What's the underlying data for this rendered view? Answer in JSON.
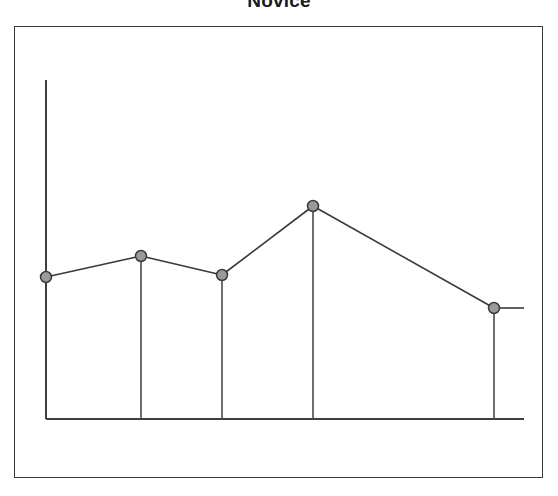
{
  "figure": {
    "title": "Novice",
    "background_color": "#ffffff",
    "frame": {
      "x": 14,
      "y": 26,
      "width": 529,
      "height": 452,
      "border_color": "#3a3a3a"
    }
  },
  "axes": {
    "origin_x": 46,
    "baseline_y": 419,
    "y_axis_top_y": 80,
    "x_axis_right_x": 524,
    "axis_color": "#3f3f3f",
    "x_tick_labels": [],
    "y_tick_labels": [],
    "xlabel": "",
    "ylabel": "",
    "grid": false
  },
  "style": {
    "marker_fill": "#9a9a9a",
    "marker_stroke": "#3a3a3a",
    "marker_radius": 5.5,
    "line_color": "#3a3a3a",
    "drop_line_color": "#4a4a4a"
  },
  "chart_data": {
    "type": "line",
    "title": "Novice",
    "xlabel": "",
    "ylabel": "",
    "grid": false,
    "legend": null,
    "categories": [
      "1",
      "2",
      "3",
      "4",
      "5"
    ],
    "x": [
      46,
      141,
      222,
      313,
      494
    ],
    "y_pixels": [
      277,
      256,
      275,
      206,
      308
    ],
    "values": [
      41,
      52,
      42,
      79,
      26
    ],
    "ylim": [
      0,
      100
    ],
    "annotations": []
  }
}
